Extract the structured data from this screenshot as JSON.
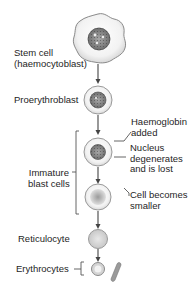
{
  "diagram": {
    "stages": [
      {
        "id": "stem",
        "label": "Stem cell\n(haemocytoblast)"
      },
      {
        "id": "proerythroblast",
        "label": "Proerythroblast"
      },
      {
        "id": "immature",
        "label": "Immature\nblast cells"
      },
      {
        "id": "reticulocyte",
        "label": "Reticulocyte"
      },
      {
        "id": "erythrocytes",
        "label": "Erythrocytes"
      }
    ],
    "annotations": [
      {
        "id": "haemoglobin",
        "label": "Haemoglobin\nadded"
      },
      {
        "id": "nucleus",
        "label": "Nucleus\ndegenerates\nand is lost"
      },
      {
        "id": "smaller",
        "label": "Cell becomes\nsmaller"
      }
    ]
  }
}
